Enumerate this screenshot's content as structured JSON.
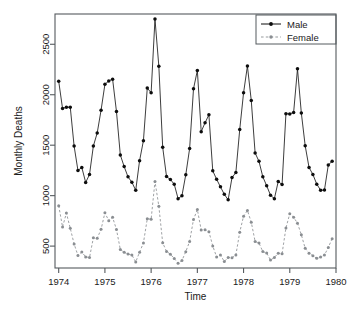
{
  "chart_data": {
    "type": "line",
    "title": "",
    "subtitle": "",
    "xlabel": "Time",
    "ylabel": "Monthly Deaths",
    "xlim": [
      1973.92,
      1980.0
    ],
    "ylim": [
      283,
      2800
    ],
    "xticks": [
      1974,
      1975,
      1976,
      1977,
      1978,
      1979,
      1980
    ],
    "xticklabels": [
      "1974",
      "1975",
      "1976",
      "1977",
      "1978",
      "1979",
      "1980"
    ],
    "yticks": [
      500,
      1000,
      1500,
      2000,
      2500
    ],
    "yticklabels": [
      "500",
      "1000",
      "1500",
      "2000",
      "2500"
    ],
    "grid": false,
    "legend_position": "top-right",
    "x": [
      1974.0,
      1974.0833,
      1974.1667,
      1974.25,
      1974.3333,
      1974.4167,
      1974.5,
      1974.5833,
      1974.6667,
      1974.75,
      1974.8333,
      1974.9167,
      1975.0,
      1975.0833,
      1975.1667,
      1975.25,
      1975.3333,
      1975.4167,
      1975.5,
      1975.5833,
      1975.6667,
      1975.75,
      1975.8333,
      1975.9167,
      1976.0,
      1976.0833,
      1976.1667,
      1976.25,
      1976.3333,
      1976.4167,
      1976.5,
      1976.5833,
      1976.6667,
      1976.75,
      1976.8333,
      1976.9167,
      1977.0,
      1977.0833,
      1977.1667,
      1977.25,
      1977.3333,
      1977.4167,
      1977.5,
      1977.5833,
      1977.6667,
      1977.75,
      1977.8333,
      1977.9167,
      1978.0,
      1978.0833,
      1978.1667,
      1978.25,
      1978.3333,
      1978.4167,
      1978.5,
      1978.5833,
      1978.6667,
      1978.75,
      1978.8333,
      1978.9167,
      1979.0,
      1979.0833,
      1979.1667,
      1979.25,
      1979.3333,
      1979.4167,
      1979.5,
      1979.5833,
      1979.6667,
      1979.75,
      1979.8333,
      1979.9167
    ],
    "series": [
      {
        "name": "Male",
        "color": "#0d0d0d",
        "linestyle": "solid",
        "marker": "filled-circle",
        "values": [
          2134,
          1863,
          1877,
          1877,
          1492,
          1249,
          1280,
          1131,
          1209,
          1492,
          1621,
          1846,
          2103,
          2137,
          2153,
          1833,
          1403,
          1288,
          1186,
          1133,
          1053,
          1347,
          1545,
          2066,
          2020,
          2750,
          2283,
          1479,
          1189,
          1160,
          1113,
          970,
          999,
          1208,
          1467,
          2059,
          2240,
          1634,
          1722,
          1801,
          1246,
          1162,
          1087,
          1013,
          959,
          1179,
          1229,
          1655,
          2019,
          2284,
          1942,
          1423,
          1340,
          1187,
          1098,
          1004,
          970,
          1140,
          1110,
          1812,
          1809,
          1825,
          2257,
          1819,
          1494,
          1279,
          1210,
          1114,
          1054,
          1055,
          1304,
          1341
        ]
      },
      {
        "name": "Female",
        "color": "#8a8e92",
        "linestyle": "dashed",
        "marker": "filled-circle",
        "values": [
          901,
          689,
          827,
          677,
          522,
          406,
          441,
          393,
          387,
          582,
          578,
          666,
          830,
          752,
          785,
          664,
          467,
          438,
          421,
          412,
          343,
          440,
          531,
          771,
          767,
          1141,
          896,
          532,
          447,
          420,
          376,
          330,
          357,
          445,
          546,
          764,
          862,
          660,
          663,
          643,
          502,
          392,
          411,
          348,
          387,
          385,
          411,
          638,
          796,
          853,
          737,
          546,
          530,
          446,
          431,
          362,
          387,
          430,
          425,
          679,
          821,
          785,
          727,
          612,
          478,
          429,
          405,
          379,
          393,
          411,
          487,
          574
        ]
      }
    ],
    "legend": [
      {
        "label": "Male",
        "color": "#0d0d0d",
        "linestyle": "solid",
        "marker": "filled-circle"
      },
      {
        "label": "Female",
        "color": "#8a8e92",
        "linestyle": "dashed",
        "marker": "filled-circle"
      }
    ],
    "colors": {
      "male": "#0d0d0d",
      "female": "#8a8e92",
      "axis": "#555a5e",
      "text": "#1a1a1a",
      "background": "#ffffff"
    }
  }
}
